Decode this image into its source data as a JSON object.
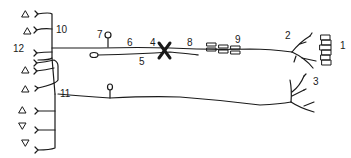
{
  "diagram": {
    "type": "neuron pathway schematic",
    "stroke_color": "#1a1a1a",
    "background": "#ffffff",
    "labels": [
      {
        "id": "1",
        "text": "1",
        "x": 340,
        "y": 41
      },
      {
        "id": "2",
        "text": "2",
        "x": 285,
        "y": 31
      },
      {
        "id": "3",
        "text": "3",
        "x": 313,
        "y": 77
      },
      {
        "id": "4",
        "text": "4",
        "x": 150,
        "y": 38
      },
      {
        "id": "5",
        "text": "5",
        "x": 139,
        "y": 56
      },
      {
        "id": "6",
        "text": "6",
        "x": 127,
        "y": 38
      },
      {
        "id": "7",
        "text": "7",
        "x": 97,
        "y": 30
      },
      {
        "id": "8",
        "text": "8",
        "x": 187,
        "y": 38
      },
      {
        "id": "9",
        "text": "9",
        "x": 235,
        "y": 35
      },
      {
        "id": "10",
        "text": "10",
        "x": 56,
        "y": 25
      },
      {
        "id": "11",
        "text": "11",
        "x": 60,
        "y": 88
      },
      {
        "id": "12",
        "text": "12",
        "x": 13,
        "y": 44
      }
    ],
    "symbols": {
      "lesion_marker": "X",
      "left_receptors": "triangle",
      "right_cell_stack": "rectangles",
      "myelin_segments": "rectangles"
    }
  }
}
